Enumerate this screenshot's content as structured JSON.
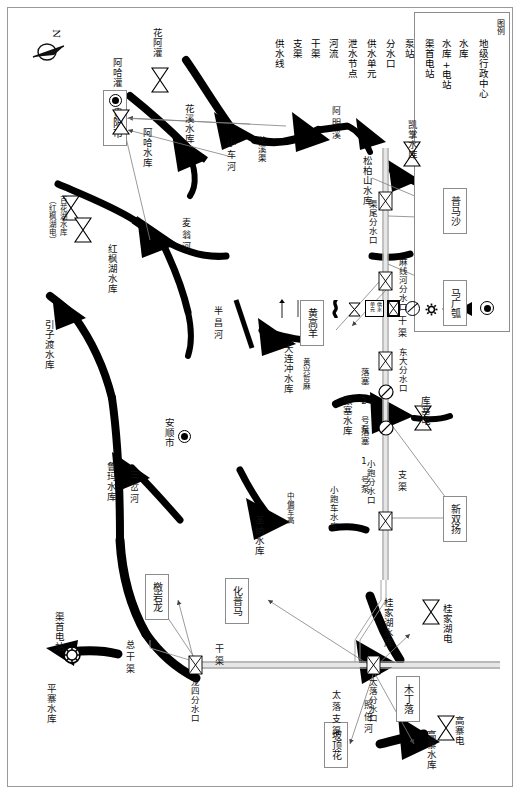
{
  "meta": {
    "orientation_note": "map sheet printed rotated 90 degrees; all CJK labels read vertically",
    "north_arrow_label": "N"
  },
  "legend": {
    "title": "图例",
    "entries": [
      {
        "label": "地级行政中心",
        "icon": "admin-center-icon"
      },
      {
        "label": "水库",
        "icon": "reservoir-icon"
      },
      {
        "label": "水库+电站",
        "icon": "reservoir-powerstation-icon"
      },
      {
        "label": "渠首电站",
        "icon": "canal-head-powerstation-icon"
      },
      {
        "label": "泵站",
        "icon": "pump-station-icon"
      },
      {
        "label": "分水口",
        "icon": "water-diversion-icon"
      },
      {
        "label": "供水单元",
        "icon": "supply-unit-icon"
      },
      {
        "label": "泄水节点",
        "icon": "discharge-node-icon"
      },
      {
        "label": "河流",
        "icon": "river-icon"
      },
      {
        "label": "干渠",
        "icon": "main-canal-icon"
      },
      {
        "label": "支渠",
        "icon": "branch-canal-icon"
      },
      {
        "label": "供水线",
        "icon": "supply-line-icon"
      }
    ]
  },
  "cities": [
    {
      "name": "贵阳市",
      "type": "地级行政中心",
      "boxed": true
    },
    {
      "name": "安顺市",
      "type": "地级行政中心",
      "boxed": false
    }
  ],
  "reservoirs": [
    {
      "name": "花溪水库"
    },
    {
      "name": "阿哈水库"
    },
    {
      "name": "百花湖水库\n（红枫湖电）"
    },
    {
      "name": "红枫湖水库"
    },
    {
      "name": "引子渡水库"
    },
    {
      "name": "鲁玛水库"
    },
    {
      "name": "大连冲水库"
    },
    {
      "name": "革纳水库"
    },
    {
      "name": "张塞水库"
    },
    {
      "name": "小跑车水库"
    },
    {
      "name": "松柏山水库"
    },
    {
      "name": "桂家湖水库"
    },
    {
      "name": "高寨水库"
    },
    {
      "name": "平寨水库"
    }
  ],
  "power_stations": [
    {
      "name": "渠首电站"
    },
    {
      "name": "花阿灌"
    },
    {
      "name": "阿哈灌"
    },
    {
      "name": "松柏山水库"
    },
    {
      "name": "凯掌水库"
    },
    {
      "name": "库塞电"
    },
    {
      "name": "桂家湖电"
    },
    {
      "name": "高寨电"
    }
  ],
  "pump_stations": [
    {
      "name": "落塞 1 号泵"
    },
    {
      "name": "落塞 2 号泵"
    }
  ],
  "diversions": [
    {
      "name": "渠尾分水口"
    },
    {
      "name": "麻线河分水口"
    },
    {
      "name": "东大分水口"
    },
    {
      "name": "小跑分水口"
    },
    {
      "name": "龙四分水口"
    },
    {
      "name": "太落分水口"
    }
  ],
  "supply_units": [
    {
      "name": "普马沙"
    },
    {
      "name": "马广瓠"
    },
    {
      "name": "黄高羊"
    },
    {
      "name": "新双扬"
    },
    {
      "name": "化普马"
    },
    {
      "name": "檄岩龙"
    },
    {
      "name": "木丁落"
    },
    {
      "name": "坡顶花"
    }
  ],
  "rivers": [
    {
      "name": "麦翁河"
    },
    {
      "name": "半昌河"
    },
    {
      "name": "小车河"
    },
    {
      "name": "阿明溪"
    },
    {
      "name": "三岔河"
    },
    {
      "name": "照倍河"
    },
    {
      "name": "花溪渠"
    }
  ],
  "canals": [
    {
      "name": "干渠",
      "type": "main"
    },
    {
      "name": "支渠",
      "type": "branch"
    },
    {
      "name": "总干渠",
      "type": "main"
    },
    {
      "name": "太落支渠",
      "type": "branch"
    }
  ],
  "scattered_labels": [
    "黄兴哲麻",
    "中偏军高",
    "花溪渠"
  ]
}
